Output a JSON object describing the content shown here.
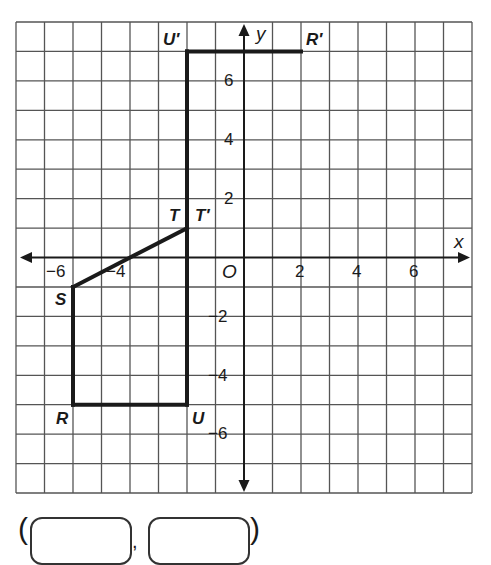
{
  "diagram": {
    "type": "coordinate-plane",
    "axes": {
      "x_label": "x",
      "y_label": "y",
      "origin_label": "O",
      "range": {
        "x": [
          -8,
          8
        ],
        "y": [
          -8,
          8
        ]
      }
    },
    "x_tick_labels": [
      "−6",
      "−4",
      "2",
      "4",
      "6"
    ],
    "y_tick_labels": [
      "6",
      "4",
      "2",
      "−2",
      "−4",
      "−6"
    ],
    "points": [
      {
        "name": "R",
        "x": -6,
        "y": -5
      },
      {
        "name": "S",
        "x": -6,
        "y": -1
      },
      {
        "name": "T",
        "x": -2,
        "y": 1
      },
      {
        "name": "U",
        "x": -2,
        "y": -5
      },
      {
        "name": "T′",
        "x": -2,
        "y": 1
      },
      {
        "name": "U′",
        "x": -2,
        "y": 7
      },
      {
        "name": "R′",
        "x": 2,
        "y": 7
      }
    ],
    "segments": [
      [
        "T",
        "S"
      ],
      [
        "S",
        "R"
      ],
      [
        "R",
        "U"
      ],
      [
        "U",
        "T′"
      ],
      [
        "T′",
        "U′"
      ],
      [
        "U′",
        "R′"
      ]
    ],
    "colors": {
      "grid": "#555555",
      "lines": "#1a1a1a",
      "background": "#ffffff"
    }
  },
  "labels": {
    "U_prime": "U′",
    "R_prime": "R′",
    "T": "T",
    "T_prime": "T′",
    "S": "S",
    "R": "R",
    "U": "U",
    "O": "O",
    "x": "x",
    "y": "y",
    "xm6": "−6",
    "xm4": "−4",
    "x2": "2",
    "x4": "4",
    "x6": "6",
    "y6": "6",
    "y4": "4",
    "y2": "2",
    "ym2": "−2",
    "ym4": "−4",
    "ym6": "−6"
  },
  "answer": {
    "open_paren": "(",
    "comma": ",",
    "close_paren": ")",
    "x_value": "",
    "y_value": ""
  }
}
